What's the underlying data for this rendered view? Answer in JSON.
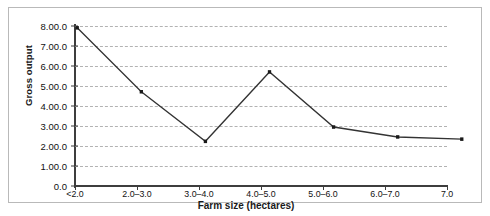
{
  "chart_data": {
    "type": "line",
    "title": "",
    "xlabel": "Farm size (hectares)",
    "ylabel": "Gross output",
    "categories": [
      "<2.0",
      "2.0–3.0",
      "3.0–4.0",
      "4.0–5.0",
      "5.0–6.0",
      "6.0–7.0",
      "7.0"
    ],
    "values": [
      8.0,
      5.1,
      2.85,
      6.0,
      3.5,
      3.05,
      2.95
    ],
    "series": [
      {
        "name": "Gross output",
        "values": [
          8.0,
          5.1,
          2.85,
          6.0,
          3.5,
          3.05,
          2.95
        ]
      }
    ],
    "ylim": [
      0,
      8
    ],
    "xlim": [
      0,
      6
    ],
    "ytick_values": [
      8.0,
      7.0,
      6.0,
      5.0,
      4.0,
      3.0,
      2.0,
      1.0,
      0.0
    ],
    "ytick_labels": [
      "8.00.0",
      "7.00.0",
      "6.00.0",
      "5.00.0",
      "4.00.0",
      "3.00.0",
      "2.00.0",
      "1.00.0",
      "0.0"
    ],
    "xtick_labels": [
      "<2.0",
      "2.0–3.0",
      "3.0–4.0",
      "4.0–5.0",
      "5.0–6.0",
      "6.0–7.0",
      "7.0"
    ],
    "grid": true,
    "grid_style": "dashed-horizontal",
    "legend": null,
    "legend_position": "none",
    "marker": "square",
    "line_color": "#333333",
    "marker_color": "#1a1a1a",
    "grid_color": "#b2b2b2",
    "axis_color": "#3d3d3d",
    "background_color": "#ffffff",
    "border_color": "#b9b9b9"
  }
}
